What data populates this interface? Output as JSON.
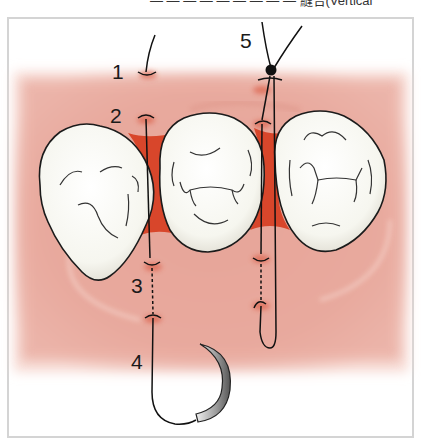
{
  "figure": {
    "caption_fragment": "— — — — — — — — — 縫合(Vertical",
    "step_labels": [
      {
        "id": "1",
        "text": "1"
      },
      {
        "id": "2",
        "text": "2"
      },
      {
        "id": "3",
        "text": "3"
      },
      {
        "id": "4",
        "text": "4"
      },
      {
        "id": "5",
        "text": "5"
      }
    ],
    "teeth_count": 3,
    "colors": {
      "gingiva": "#e9a89c",
      "gingiva_light": "#f4cfc6",
      "papilla": "#d9452a",
      "tooth": "#fbfbf6",
      "suture": "#111111",
      "needle": "#8a8a8a",
      "frame": "#d4d4d4"
    }
  }
}
